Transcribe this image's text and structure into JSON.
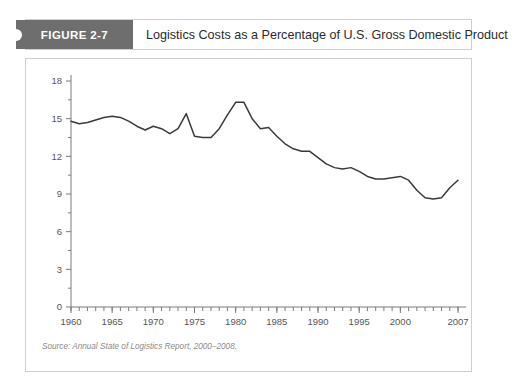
{
  "figure": {
    "badge_label": "FIGURE 2-7",
    "title": "Logistics Costs as a Percentage of U.S. Gross Domestic Product",
    "source_note": "Source: Annual State of Logistics Report, 2000–2008."
  },
  "colors": {
    "badge_background": "#6e6e6e",
    "badge_text": "#ffffff",
    "line": "#3a3a3a",
    "axis": "#7a7a7a",
    "border": "#cfcfcf",
    "tick_label": "#555555",
    "source_text": "#8a8a8a"
  },
  "chart_data": {
    "type": "line",
    "title": "Logistics Costs as a Percentage of U.S. Gross Domestic Product",
    "xlabel": "",
    "ylabel": "",
    "xlim": [
      1960,
      2007
    ],
    "ylim": [
      0,
      18
    ],
    "yticks": [
      0,
      3,
      6,
      9,
      12,
      15,
      18
    ],
    "ytick_labels": [
      "0",
      "3",
      "6",
      "9",
      "12",
      "15",
      "18"
    ],
    "xticks": [
      1960,
      1965,
      1970,
      1975,
      1980,
      1985,
      1990,
      1995,
      2000,
      2007
    ],
    "xtick_labels": [
      "1960",
      "1965",
      "1970",
      "1975",
      "1980",
      "1985",
      "1990",
      "1995",
      "2000",
      "2007"
    ],
    "minor_xtick_interval": 1,
    "grid": false,
    "legend": "none",
    "series": [
      {
        "name": "Logistics Costs as % of GDP",
        "x": [
          1960,
          1961,
          1962,
          1963,
          1964,
          1965,
          1966,
          1967,
          1968,
          1969,
          1970,
          1971,
          1972,
          1973,
          1974,
          1975,
          1976,
          1977,
          1978,
          1979,
          1980,
          1981,
          1982,
          1983,
          1984,
          1985,
          1986,
          1987,
          1988,
          1989,
          1990,
          1991,
          1992,
          1993,
          1994,
          1995,
          1996,
          1997,
          1998,
          1999,
          2000,
          2001,
          2002,
          2003,
          2004,
          2005,
          2006,
          2007
        ],
        "values": [
          14.8,
          14.6,
          14.7,
          14.9,
          15.1,
          15.2,
          15.1,
          14.8,
          14.4,
          14.1,
          14.4,
          14.2,
          13.8,
          14.2,
          15.4,
          13.6,
          13.5,
          13.5,
          14.2,
          15.3,
          16.3,
          16.3,
          15.0,
          14.2,
          14.3,
          13.6,
          13.0,
          12.6,
          12.4,
          12.4,
          11.9,
          11.4,
          11.1,
          11.0,
          11.1,
          10.8,
          10.4,
          10.2,
          10.2,
          10.3,
          10.4,
          10.1,
          9.3,
          8.7,
          8.6,
          8.7,
          9.5,
          10.1
        ]
      }
    ],
    "annotations": {
      "peak": {
        "year": 1981,
        "value": 16.3
      },
      "trough": {
        "year": 2003,
        "value": 8.6
      },
      "start": {
        "year": 1960,
        "value": 14.8
      },
      "end": {
        "year": 2007,
        "value": 10.1
      }
    }
  }
}
